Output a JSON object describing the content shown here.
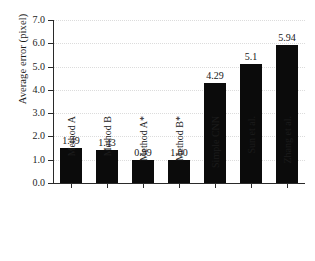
{
  "chart_data": {
    "type": "bar",
    "title": "",
    "subtitle": "",
    "xlabel": "",
    "ylabel": "Average error (pixel)",
    "ylim": [
      0.0,
      7.0
    ],
    "ytick_labels": [
      "0.0",
      "1.0",
      "2.0",
      "3.0",
      "4.0",
      "5.0",
      "6.0",
      "7.0"
    ],
    "ytick_values": [
      0.0,
      1.0,
      2.0,
      3.0,
      4.0,
      5.0,
      6.0,
      7.0
    ],
    "grid": true,
    "grid_axis": "y",
    "legend": false,
    "legend_position": "none",
    "bar_color": "#0b0b0b",
    "categories": [
      "Method A",
      "Method B",
      "Method A*",
      "Method B*",
      "Simple CNN",
      "Sun et al.",
      "Zhang et al."
    ],
    "values": [
      1.49,
      1.43,
      0.99,
      1.0,
      4.29,
      5.1,
      5.94
    ],
    "data_labels": [
      "1.49",
      "1.43",
      "0.99",
      "1.00",
      "4.29",
      "5.1",
      "5.94"
    ],
    "annotations": []
  },
  "colors": {
    "background": "#ffffff",
    "bar": "#0b0b0b",
    "axis": "#2a2a2a",
    "grid": "#dcdcdc",
    "text": "#1c1c1c"
  }
}
